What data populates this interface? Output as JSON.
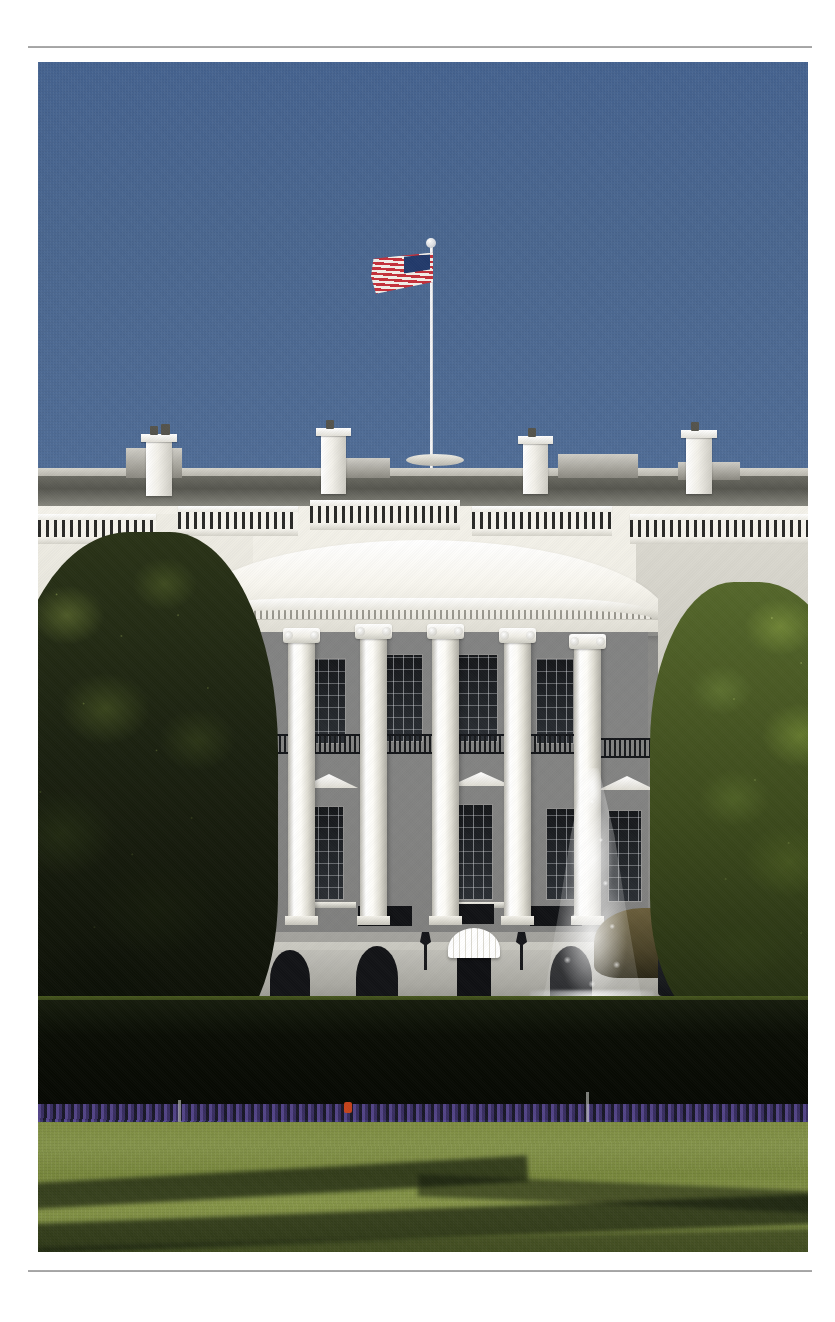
{
  "page": {
    "background_color": "#ffffff",
    "width": 835,
    "height": 1322,
    "rules": {
      "top_rule_color": "#8d8d8d",
      "bottom_rule_color": "#8d8d8d"
    }
  },
  "photo": {
    "subject": "The White House South Facade",
    "description": "Photograph of the White House viewed from the South Lawn, showing the curved South Portico with Ionic columns, the Truman Balcony, the American flag flying above the roof, a fountain spraying water on the lawn, a dark hedge with a bed of purple flowers, and a sunlit green lawn crossed by tree shadows.",
    "left": 38,
    "top": 62,
    "width": 770,
    "height": 1190,
    "colors": {
      "sky": "#4e6b95",
      "sky_horizon": "#5e79a2",
      "facade_white": "#f2f0e8",
      "shadow_gray": "#a3a29d",
      "lawn_green": "#7e8d40",
      "hedge_dark": "#0a0d05",
      "flower_purple": "#5a4a93",
      "flower_red": "#c4431c",
      "tree_left_dark": "#1b2110",
      "tree_right_sunlit": "#65792f",
      "flag_red": "#c4303a",
      "flag_blue": "#223a6b",
      "flag_white": "#f3eee8",
      "water_white": "#ffffff"
    },
    "elements": {
      "flag": {
        "name": "American flag",
        "pole_height_px": 290
      },
      "portico": {
        "name": "South Portico",
        "column_count": 6,
        "column_order": "Ionic"
      },
      "balcony": {
        "name": "Truman Balcony"
      },
      "awning": {
        "name": "Ground floor entrance awning",
        "color": "#ffffff"
      },
      "fountain": {
        "name": "South Lawn fountain"
      },
      "hedge": {
        "name": "Boxwood hedge"
      },
      "flowerbed": {
        "name": "Flower bed",
        "dominant_color": "purple",
        "accent_count": 1
      },
      "lawn": {
        "name": "South Lawn"
      },
      "vehicle": {
        "name": "Dark parked vehicle"
      },
      "chimneys": [
        {
          "label": "left chimney"
        },
        {
          "label": "center chimney"
        },
        {
          "label": "right chimney"
        }
      ]
    }
  }
}
